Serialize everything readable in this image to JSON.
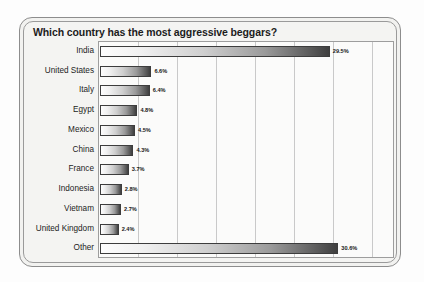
{
  "chart_data": {
    "type": "bar",
    "orientation": "horizontal",
    "title": "Which country has the most aggressive beggars?",
    "xlabel": "",
    "ylabel": "",
    "xlim": [
      0,
      38
    ],
    "grid": true,
    "gridline_interval": 5,
    "legend": false,
    "value_suffix": "%",
    "categories": [
      "India",
      "United States",
      "Italy",
      "Egypt",
      "Mexico",
      "China",
      "France",
      "Indonesia",
      "Vietnam",
      "United Kingdom",
      "Other"
    ],
    "values": [
      29.5,
      6.6,
      6.4,
      4.8,
      4.5,
      4.3,
      3.7,
      2.8,
      2.7,
      2.4,
      30.6
    ],
    "value_labels": [
      "29.5%",
      "6.6%",
      "6.4%",
      "4.8%",
      "4.5%",
      "4.3%",
      "3.7%",
      "2.8%",
      "2.7%",
      "2.4%",
      "30.6%"
    ]
  },
  "colors": {
    "bar_gradient_start": "#fdfdfd",
    "bar_gradient_end": "#3f3f3f",
    "bar_outline": "#3d3d3d",
    "plot_background": "#fbfbfa",
    "panel_background": "#f2f2f0",
    "gridline": "#c9c9c9",
    "text": "#1c1c1c"
  }
}
